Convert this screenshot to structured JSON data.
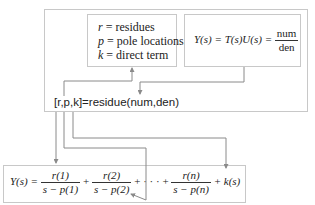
{
  "definitions": {
    "r_label": "r",
    "r_text": " = residues",
    "p_label": "p",
    "p_text": " = pole locations",
    "k_label": "k",
    "k_text": " = direct term"
  },
  "transfer_function": {
    "lhs": "Y(s) = T(s)U(s) = ",
    "numerator": "num",
    "denominator": "den"
  },
  "command": "[r,p,k]=residue(num,den)",
  "expansion": {
    "lhs": "Y(s) = ",
    "terms": [
      {
        "numerator": "r(1)",
        "denominator": "s − p(1)"
      },
      {
        "numerator": "r(2)",
        "denominator": "s − p(2)"
      },
      {
        "numerator": "r(n)",
        "denominator": "s − p(n)"
      }
    ],
    "plus": " + ",
    "ellipsis": " + · · · + ",
    "direct_term": " + k(s)"
  },
  "colors": {
    "box_border": "#c8c8c8",
    "arrow": "#8a8a8a",
    "text": "#222222"
  }
}
